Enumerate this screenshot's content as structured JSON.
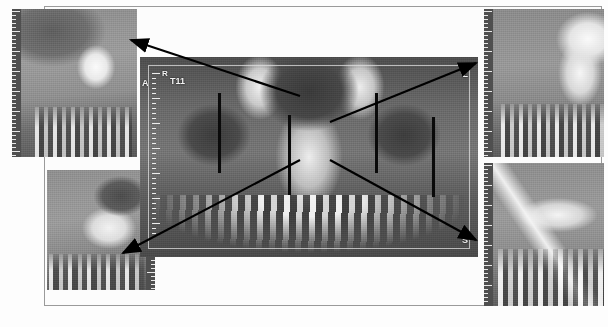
{
  "figure": {
    "modality": "CBCT",
    "view_type": "coronal-reformat-with-cross-sections",
    "panel_count": 5
  },
  "central_panel": {
    "name": "coronal-reformatted-view",
    "orientation_labels": {
      "anterior": "A",
      "right": "R",
      "slice_id": "T11",
      "left": "L",
      "superior": "S"
    },
    "slice_markers": [
      {
        "id": "marker-1",
        "x": 78,
        "y": 36,
        "height": 80
      },
      {
        "id": "marker-2",
        "x": 148,
        "y": 58,
        "height": 80
      },
      {
        "id": "marker-3",
        "x": 235,
        "y": 36,
        "height": 80
      },
      {
        "id": "marker-4",
        "x": 292,
        "y": 60,
        "height": 80
      }
    ],
    "ruler": {
      "visible": true,
      "position": "left",
      "tick_count": 30
    }
  },
  "cross_sections": [
    {
      "id": "panel-top-left",
      "label": "cross-section-top-left",
      "ruler_position": "left",
      "finding": "radiopaque-lesion"
    },
    {
      "id": "panel-bottom-left",
      "label": "cross-section-bottom-left",
      "ruler_position": "right",
      "finding": "trabecular-bone"
    },
    {
      "id": "panel-top-right",
      "label": "cross-section-top-right",
      "ruler_position": "left",
      "finding": "maxillary-sinus"
    },
    {
      "id": "panel-bottom-right",
      "label": "cross-section-bottom-right",
      "ruler_position": "left",
      "finding": "sinus-floor"
    }
  ],
  "leader_lines": [
    {
      "id": "leader-to-top-left",
      "from": [
        300,
        96
      ],
      "to": [
        131,
        40
      ],
      "arrow_at": "to"
    },
    {
      "id": "leader-to-bottom-left",
      "from": [
        300,
        160
      ],
      "to": [
        123,
        253
      ],
      "arrow_at": "to"
    },
    {
      "id": "leader-to-top-right",
      "from": [
        330,
        122
      ],
      "to": [
        476,
        63
      ],
      "arrow_at": "to"
    },
    {
      "id": "leader-to-bottom-right",
      "from": [
        330,
        160
      ],
      "to": [
        476,
        240
      ],
      "arrow_at": "to"
    }
  ],
  "colors": {
    "background": "#ffffff",
    "frame_border": "#9a9a9a",
    "scan_dark": "#4a4a4a",
    "scan_mid": "#8f8f8f",
    "scan_bright": "#f2f2f2",
    "leader_line": "#000000",
    "label_text": "#f2f2f2"
  }
}
